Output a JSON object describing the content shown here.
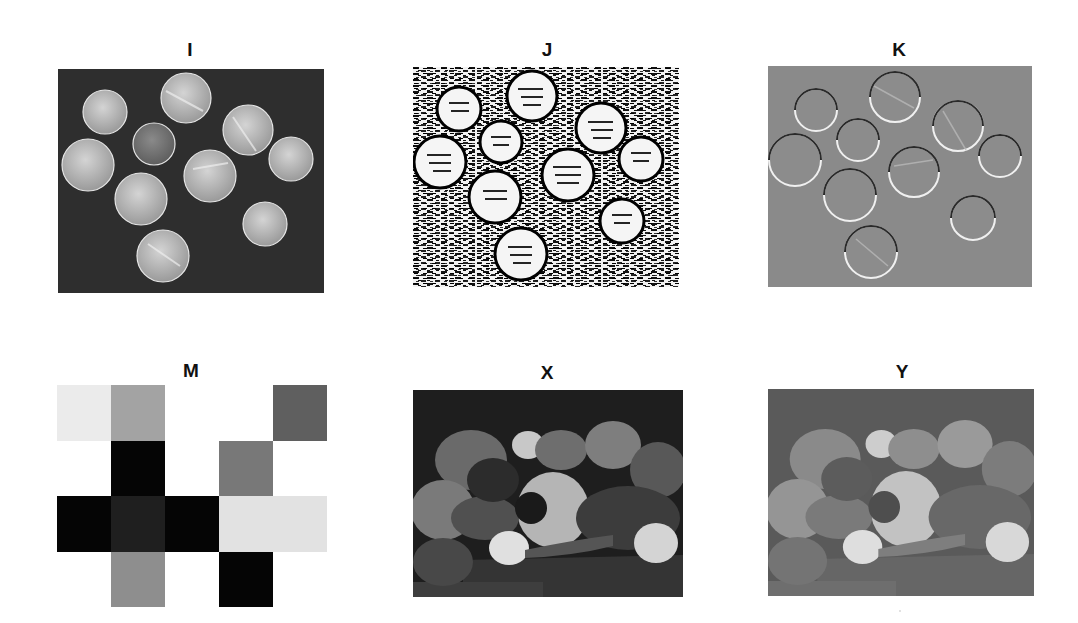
{
  "figure": {
    "panels": [
      {
        "id": "I",
        "title": "I",
        "description": "Grayscale photo of coins on dark background"
      },
      {
        "id": "J",
        "title": "J",
        "description": "High-contrast edge/emboss filtered coins (black & white noisy)"
      },
      {
        "id": "K",
        "title": "K",
        "description": "Embossed coins on mid-gray background"
      },
      {
        "id": "M",
        "title": "M",
        "description": "5x4 grayscale block matrix"
      },
      {
        "id": "X",
        "title": "X",
        "description": "Grayscale photo of peppers (high contrast)"
      },
      {
        "id": "Y",
        "title": "Y",
        "description": "Grayscale photo of peppers (reduced contrast)"
      }
    ],
    "matrix_M": {
      "rows": 4,
      "cols": 5,
      "cells": [
        [
          "#ebebeb",
          "#a3a3a3",
          "#ffffff",
          "#ffffff",
          "#5f5f5f"
        ],
        [
          "#ffffff",
          "#050505",
          "#ffffff",
          "#787878",
          "#ffffff"
        ],
        [
          "#050505",
          "#1f1f1f",
          "#050505",
          "#e2e2e2",
          "#e2e2e2"
        ],
        [
          "#ffffff",
          "#8e8e8e",
          "#ffffff",
          "#050505",
          "#ffffff"
        ]
      ]
    },
    "colors": {
      "coins_bg": "#2e2e2e",
      "coin_fill": "#b8b8b8",
      "emboss_bg": "#8a8a8a",
      "peppers_bg_X": "#1e1e1e",
      "peppers_bg_Y": "#5a5a5a"
    }
  }
}
